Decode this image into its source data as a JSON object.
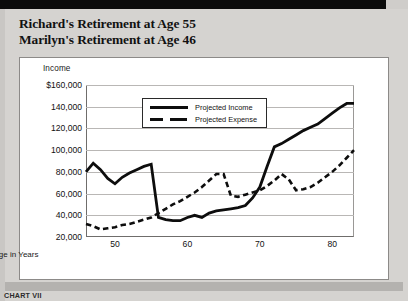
{
  "header": {
    "line1": "Richard's Retirement at Age 55",
    "line2": "Marilyn's Retirement at Age 46"
  },
  "caption": "CHART VII",
  "legend": {
    "income_label": "Projected Income",
    "expense_label": "Projected Expense"
  },
  "colors": {
    "page_background": "#d5d3d0",
    "panel_background": "#ffffff",
    "line": "#0d0d0d",
    "gridline": "#b9b7b5",
    "axis": "#6f6d6b",
    "topbar": "#0b0b0b"
  },
  "chart_data": {
    "type": "line",
    "xlabel": "Age in Years",
    "ylabel": "Income",
    "ylim": [
      20000,
      160000
    ],
    "xlim": [
      46,
      83
    ],
    "grid": true,
    "legend_position": "top-center",
    "ytick_labels": [
      "$160,000",
      "140,000",
      "120,000",
      "100,000",
      "80,000",
      "60,000",
      "40,000",
      "20,000"
    ],
    "ytick_values": [
      160000,
      140000,
      120000,
      100000,
      80000,
      60000,
      40000,
      20000
    ],
    "xtick_labels": [
      "50",
      "60",
      "70",
      "80"
    ],
    "xtick_values": [
      50,
      60,
      70,
      80
    ],
    "series": [
      {
        "name": "Projected Income",
        "style": "solid",
        "x": [
          46,
          47,
          48,
          49,
          50,
          51,
          52,
          53,
          54,
          55,
          56,
          57,
          58,
          59,
          60,
          61,
          62,
          63,
          64,
          65,
          66,
          67,
          68,
          69,
          70,
          71,
          72,
          73,
          74,
          75,
          76,
          77,
          78,
          79,
          80,
          81,
          82,
          83
        ],
        "y": [
          80000,
          88000,
          82000,
          74000,
          69000,
          75000,
          79000,
          82000,
          85000,
          87000,
          38000,
          36000,
          35000,
          35000,
          38000,
          40000,
          38000,
          42000,
          44000,
          45000,
          46000,
          47000,
          49000,
          56000,
          66000,
          85000,
          103000,
          106000,
          110000,
          114000,
          118000,
          121000,
          124000,
          129000,
          134000,
          139000,
          143000,
          143000
        ]
      },
      {
        "name": "Projected Expense",
        "style": "dashed",
        "x": [
          46,
          47,
          48,
          49,
          50,
          51,
          52,
          53,
          54,
          55,
          56,
          57,
          58,
          59,
          60,
          61,
          62,
          63,
          64,
          65,
          66,
          67,
          68,
          69,
          70,
          71,
          72,
          73,
          74,
          75,
          76,
          77,
          78,
          79,
          80,
          81,
          82,
          83
        ],
        "y": [
          32000,
          30000,
          27000,
          28000,
          29000,
          31000,
          32000,
          34000,
          36000,
          38000,
          42000,
          46000,
          50000,
          53000,
          57000,
          61000,
          66000,
          72000,
          78000,
          78000,
          58000,
          57000,
          59000,
          61000,
          63000,
          67000,
          72000,
          78000,
          73000,
          63000,
          64000,
          66000,
          70000,
          75000,
          80000,
          86000,
          93000,
          100000
        ]
      }
    ]
  }
}
